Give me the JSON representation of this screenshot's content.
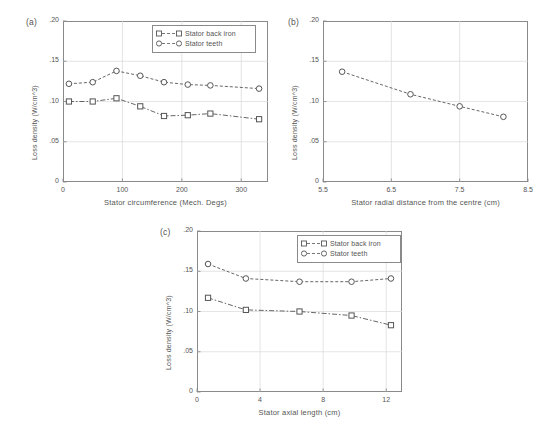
{
  "figure": {
    "background": "#ffffff",
    "line_color": "#555555",
    "frame_color": "#8a8a8a",
    "grid_color": "#d8d8d8"
  },
  "legend": {
    "series1_label": "Stator back iron",
    "series2_label": "Stator teeth",
    "series1_marker": "square-marker",
    "series2_marker": "circle-marker"
  },
  "panels": {
    "a": {
      "label": "(a)"
    },
    "b": {
      "label": "(b)"
    },
    "c": {
      "label": "(c)"
    }
  },
  "chart_data": [
    {
      "type": "line",
      "panel": "(a)",
      "title": "",
      "xlabel": "Stator circumference (Mech. Degs)",
      "ylabel": "Loss density (W/cm^3)",
      "xlim": [
        0,
        345
      ],
      "ylim": [
        0,
        0.2
      ],
      "xticks": [
        0,
        100,
        200,
        300
      ],
      "xticklabels": [
        "0",
        "100",
        "200",
        "300"
      ],
      "yticks": [
        0,
        0.05,
        0.1,
        0.15,
        0.2
      ],
      "yticklabels": [
        "0",
        ".05",
        ".10",
        ".15",
        ".20"
      ],
      "grid": true,
      "legend_position": "top-right",
      "series": [
        {
          "name": "Stator back iron",
          "marker": "square",
          "x": [
            10,
            50,
            90,
            130,
            170,
            210,
            248,
            330
          ],
          "values": [
            0.1,
            0.1,
            0.104,
            0.094,
            0.082,
            0.083,
            0.085,
            0.078
          ]
        },
        {
          "name": "Stator teeth",
          "marker": "circle",
          "x": [
            10,
            50,
            90,
            130,
            170,
            210,
            248,
            330
          ],
          "values": [
            0.122,
            0.124,
            0.138,
            0.132,
            0.124,
            0.121,
            0.12,
            0.116
          ]
        }
      ]
    },
    {
      "type": "line",
      "panel": "(b)",
      "title": "",
      "xlabel": "Stator radial distance from the centre (cm)",
      "ylabel": "Loss density (W/cm^3)",
      "xlim": [
        5.5,
        8.5
      ],
      "ylim": [
        0,
        0.2
      ],
      "xticks": [
        5.5,
        6.5,
        7.5,
        8.5
      ],
      "xticklabels": [
        "5.5",
        "6.5",
        "7.5",
        "8.5"
      ],
      "yticks": [
        0,
        0.05,
        0.1,
        0.15,
        0.2
      ],
      "yticklabels": [
        "0",
        ".05",
        ".10",
        ".15",
        ".20"
      ],
      "grid": true,
      "legend_position": "none",
      "series": [
        {
          "name": "Stator teeth",
          "marker": "circle",
          "x": [
            5.78,
            6.78,
            7.5,
            8.14
          ],
          "values": [
            0.137,
            0.109,
            0.094,
            0.081
          ]
        }
      ]
    },
    {
      "type": "line",
      "panel": "(c)",
      "title": "",
      "xlabel": "Stator axial length (cm)",
      "ylabel": "Loss density (W/cm^3)",
      "xlim": [
        0,
        13
      ],
      "ylim": [
        0,
        0.2
      ],
      "xticks": [
        0,
        4,
        8,
        12
      ],
      "xticklabels": [
        "0",
        "4",
        "8",
        "12"
      ],
      "yticks": [
        0,
        0.05,
        0.1,
        0.15,
        0.2
      ],
      "yticklabels": [
        "0",
        ".05",
        ".10",
        ".15",
        ".20"
      ],
      "grid": true,
      "legend_position": "top-right",
      "series": [
        {
          "name": "Stator back iron",
          "marker": "square",
          "x": [
            0.7,
            3.1,
            6.5,
            9.8,
            12.3
          ],
          "values": [
            0.117,
            0.102,
            0.1,
            0.095,
            0.083
          ]
        },
        {
          "name": "Stator teeth",
          "marker": "circle",
          "x": [
            0.7,
            3.1,
            6.5,
            9.8,
            12.3
          ],
          "values": [
            0.159,
            0.141,
            0.137,
            0.137,
            0.141
          ]
        }
      ]
    }
  ]
}
